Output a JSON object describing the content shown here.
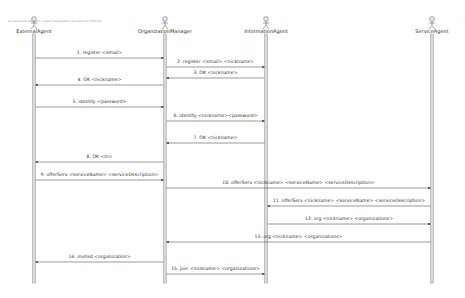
{
  "diagram": {
    "type": "sequence",
    "header_note": "sd sequence diagram - agent registration and service offering",
    "actors": [
      {
        "id": "ext",
        "name": "ExternalAgent",
        "x": 34
      },
      {
        "id": "org",
        "name": "OrganizationManager",
        "x": 165
      },
      {
        "id": "info",
        "name": "InformationAgent",
        "x": 266
      },
      {
        "id": "svc",
        "name": "ServiceAgent",
        "x": 432
      }
    ],
    "messages": [
      {
        "n": 1,
        "label": "1. register <email>",
        "from": "ext",
        "to": "org",
        "y": 58
      },
      {
        "n": 2,
        "label": "2. register <email> <nickname>",
        "from": "org",
        "to": "info",
        "y": 67
      },
      {
        "n": 3,
        "label": "3. OK <nickname>",
        "from": "info",
        "to": "org",
        "y": 78
      },
      {
        "n": 4,
        "label": "4. OK <nickname>",
        "from": "org",
        "to": "ext",
        "y": 85
      },
      {
        "n": 5,
        "label": "5. identify <password>",
        "from": "ext",
        "to": "org",
        "y": 107
      },
      {
        "n": 6,
        "label": "6. identify <nickname><password>",
        "from": "org",
        "to": "info",
        "y": 121
      },
      {
        "n": 7,
        "label": "7. OK <nickname>",
        "from": "info",
        "to": "org",
        "y": 143
      },
      {
        "n": 8,
        "label": "8. OK <In>",
        "from": "org",
        "to": "ext",
        "y": 162
      },
      {
        "n": 9,
        "label": "9. offerServ <serviceName> <serviceDescription>",
        "from": "ext",
        "to": "org",
        "y": 180
      },
      {
        "n": 10,
        "label": "10. offerServ <nickname> <serviceName> <serviceDescription>",
        "from": "org",
        "to": "svc",
        "y": 188
      },
      {
        "n": 11,
        "label": "11. offerServ <nickname> <serviceName> <serviceDescription>",
        "from": "svc",
        "to": "info",
        "y": 206
      },
      {
        "n": 12,
        "label": "12. org <nickname> <organizations>",
        "from": "info",
        "to": "svc",
        "y": 224
      },
      {
        "n": 13,
        "label": "13. org <nickname> <organizations>",
        "from": "svc",
        "to": "org",
        "y": 242
      },
      {
        "n": 14,
        "label": "14. invited <organization>",
        "from": "org",
        "to": "ext",
        "y": 262
      },
      {
        "n": 15,
        "label": "15. join <nickname> <organizations>",
        "from": "org",
        "to": "info",
        "y": 274
      }
    ],
    "colors": {
      "line": "#555555",
      "lifeline_fill": "#d8d8d8",
      "lifeline_stroke": "#999999",
      "text": "#333333"
    }
  }
}
